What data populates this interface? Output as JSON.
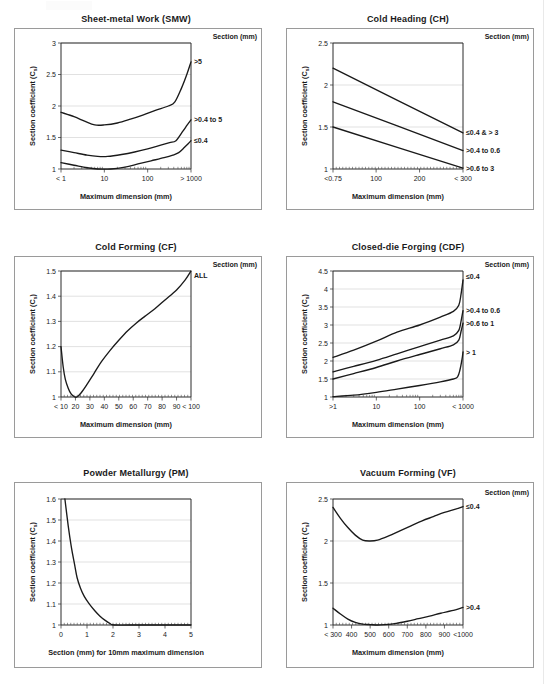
{
  "page": {
    "background": "#ffffff",
    "line_color": "#1a1a1a",
    "grid_color": "#d9d9d9",
    "panel_border_color": "#9a9a9a"
  },
  "common": {
    "ylabel": "Section coefficient (C",
    "ylabel_sub": "s",
    "ylabel_tail": ")",
    "section_header": "Section (mm)",
    "xlabel_maxdim": "Maximum dimension (mm)"
  },
  "charts": [
    {
      "id": "smw",
      "title": "Sheet-metal Work (SMW)",
      "chart_data": {
        "type": "line",
        "title": "Sheet-metal Work (SMW)",
        "xlabel": "Maximum dimension (mm)",
        "ylabel": "Section coefficient (C s)",
        "legend_title": "Section (mm)",
        "legend_position": "right-outside",
        "grid": true,
        "xscale": "log",
        "xlim": [
          1,
          1000
        ],
        "ylim": [
          1,
          3
        ],
        "yticks": [
          1,
          1.5,
          2,
          2.5,
          3
        ],
        "ytick_labels": [
          "1",
          "1.5",
          "2",
          "2.5",
          "3"
        ],
        "xticks": [
          1,
          10,
          100,
          1000
        ],
        "xtick_labels": [
          "< 1",
          "10",
          "100",
          "> 1000"
        ],
        "series": [
          {
            "name": "> 5",
            "label": "&gt;5",
            "points": [
              [
                1,
                1.9
              ],
              [
                2,
                1.83
              ],
              [
                3.5,
                1.76
              ],
              [
                6,
                1.7
              ],
              [
                10,
                1.7
              ],
              [
                20,
                1.73
              ],
              [
                40,
                1.79
              ],
              [
                80,
                1.86
              ],
              [
                150,
                1.93
              ],
              [
                300,
                2.0
              ],
              [
                420,
                2.06
              ],
              [
                600,
                2.28
              ],
              [
                800,
                2.5
              ],
              [
                1000,
                2.7
              ]
            ]
          },
          {
            "name": "> 0.4 to 5",
            "label": "&gt;0.4 to 5",
            "points": [
              [
                1,
                1.3
              ],
              [
                2,
                1.26
              ],
              [
                4,
                1.22
              ],
              [
                7,
                1.2
              ],
              [
                12,
                1.2
              ],
              [
                25,
                1.23
              ],
              [
                50,
                1.27
              ],
              [
                100,
                1.32
              ],
              [
                200,
                1.38
              ],
              [
                320,
                1.42
              ],
              [
                450,
                1.45
              ],
              [
                650,
                1.6
              ],
              [
                820,
                1.7
              ],
              [
                1000,
                1.78
              ]
            ]
          },
          {
            "name": "≤ 0.4",
            "label": "≤0.4",
            "points": [
              [
                1,
                1.1
              ],
              [
                2,
                1.06
              ],
              [
                4,
                1.02
              ],
              [
                7,
                1.0
              ],
              [
                14,
                1.0
              ],
              [
                30,
                1.03
              ],
              [
                60,
                1.08
              ],
              [
                120,
                1.13
              ],
              [
                240,
                1.18
              ],
              [
                380,
                1.22
              ],
              [
                520,
                1.26
              ],
              [
                700,
                1.34
              ],
              [
                860,
                1.4
              ],
              [
                1000,
                1.45
              ]
            ]
          }
        ]
      }
    },
    {
      "id": "ch",
      "title": "Cold Heading (CH)",
      "chart_data": {
        "type": "line",
        "title": "Cold Heading (CH)",
        "xlabel": "Maximum dimension (mm)",
        "ylabel": "Section coefficient (C s)",
        "legend_title": "Section (mm)",
        "legend_position": "right-outside",
        "grid": true,
        "xscale": "linear",
        "xlim": [
          0.75,
          300
        ],
        "ylim": [
          1,
          2.5
        ],
        "yticks": [
          1,
          1.5,
          2,
          2.5
        ],
        "ytick_labels": [
          "1",
          "1.5",
          "2",
          "2.5"
        ],
        "xticks": [
          0.75,
          100,
          200,
          300
        ],
        "xtick_labels": [
          "<0.75",
          "100",
          "200",
          "< 300"
        ],
        "series": [
          {
            "name": "≤0.4 & > 3",
            "label": "≤0.4 &amp; &gt; 3",
            "points": [
              [
                0.75,
                2.2
              ],
              [
                300,
                1.43
              ]
            ]
          },
          {
            "name": ">0.4 to 0.6",
            "label": "&gt;0.4 to 0.6",
            "points": [
              [
                0.75,
                1.8
              ],
              [
                300,
                1.22
              ]
            ]
          },
          {
            "name": ">0.6 to 3",
            "label": "&gt;0.6 to 3",
            "points": [
              [
                0.75,
                1.5
              ],
              [
                300,
                1.01
              ]
            ]
          }
        ]
      }
    },
    {
      "id": "cf",
      "title": "Cold Forming (CF)",
      "chart_data": {
        "type": "line",
        "title": "Cold Forming (CF)",
        "xlabel": "Maximum dimension (mm)",
        "ylabel": "Section coefficient (C s)",
        "legend_title": "Section (mm)",
        "legend_position": "right-outside",
        "grid": true,
        "xscale": "linear",
        "xlim": [
          10,
          100
        ],
        "ylim": [
          1,
          1.5
        ],
        "yticks": [
          1,
          1.1,
          1.2,
          1.3,
          1.4,
          1.5
        ],
        "ytick_labels": [
          "1",
          "1.1",
          "1.2",
          "1.3",
          "1.4",
          "1.5"
        ],
        "xticks": [
          10,
          20,
          30,
          40,
          50,
          60,
          70,
          80,
          90,
          100
        ],
        "xtick_labels": [
          "< 10",
          "20",
          "30",
          "40",
          "50",
          "60",
          "70",
          "80",
          "90",
          "< 100"
        ],
        "series": [
          {
            "name": "ALL",
            "label": "ALL",
            "points": [
              [
                10,
                1.2
              ],
              [
                11.5,
                1.12
              ],
              [
                13,
                1.07
              ],
              [
                15,
                1.035
              ],
              [
                17,
                1.012
              ],
              [
                19,
                1.002
              ],
              [
                21,
                1.0
              ],
              [
                24,
                1.017
              ],
              [
                28,
                1.05
              ],
              [
                33,
                1.095
              ],
              [
                38,
                1.14
              ],
              [
                44,
                1.185
              ],
              [
                50,
                1.225
              ],
              [
                56,
                1.262
              ],
              [
                62,
                1.293
              ],
              [
                68,
                1.32
              ],
              [
                75,
                1.35
              ],
              [
                82,
                1.385
              ],
              [
                90,
                1.425
              ],
              [
                96,
                1.465
              ],
              [
                100,
                1.5
              ]
            ]
          }
        ]
      }
    },
    {
      "id": "cdf",
      "title": "Closed-die Forging (CDF)",
      "chart_data": {
        "type": "line",
        "title": "Closed-die Forging (CDF)",
        "xlabel": "Maximum dimension (mm)",
        "ylabel": "Section coefficient (C s)",
        "legend_title": "Section (mm)",
        "legend_position": "right-outside",
        "grid": true,
        "xscale": "log",
        "xlim": [
          1,
          1000
        ],
        "ylim": [
          1,
          4.5
        ],
        "yticks": [
          1,
          1.5,
          2,
          2.5,
          3,
          3.5,
          4,
          4.5
        ],
        "ytick_labels": [
          "1",
          "1.5",
          "2",
          "2.5",
          "3",
          "3.5",
          "4",
          "4.5"
        ],
        "xticks": [
          1,
          10,
          100,
          1000
        ],
        "xtick_labels": [
          ">1",
          "10",
          "100",
          "< 1000"
        ],
        "series": [
          {
            "name": "≤0.4",
            "label": "≤0.4",
            "points": [
              [
                1,
                2.1
              ],
              [
                3,
                2.3
              ],
              [
                10,
                2.55
              ],
              [
                30,
                2.8
              ],
              [
                100,
                3.0
              ],
              [
                300,
                3.22
              ],
              [
                600,
                3.38
              ],
              [
                800,
                3.55
              ],
              [
                900,
                3.85
              ],
              [
                1000,
                4.25
              ]
            ]
          },
          {
            "name": ">0.4 to 0.6",
            "label": "&gt;0.4 to 0.6",
            "points": [
              [
                1,
                1.7
              ],
              [
                3,
                1.85
              ],
              [
                10,
                2.02
              ],
              [
                30,
                2.2
              ],
              [
                100,
                2.4
              ],
              [
                300,
                2.58
              ],
              [
                600,
                2.7
              ],
              [
                800,
                2.85
              ],
              [
                900,
                3.1
              ],
              [
                1000,
                3.4
              ]
            ]
          },
          {
            "name": ">0.6 to 1",
            "label": "&gt;0.6 to 1",
            "points": [
              [
                1,
                1.5
              ],
              [
                3,
                1.65
              ],
              [
                10,
                1.82
              ],
              [
                30,
                2.0
              ],
              [
                100,
                2.18
              ],
              [
                300,
                2.34
              ],
              [
                600,
                2.45
              ],
              [
                800,
                2.58
              ],
              [
                900,
                2.82
              ],
              [
                1000,
                3.05
              ]
            ]
          },
          {
            "name": "> 1",
            "label": "&gt; 1",
            "points": [
              [
                1,
                1.01
              ],
              [
                3,
                1.05
              ],
              [
                10,
                1.13
              ],
              [
                30,
                1.22
              ],
              [
                100,
                1.32
              ],
              [
                300,
                1.42
              ],
              [
                600,
                1.5
              ],
              [
                750,
                1.56
              ],
              [
                850,
                1.75
              ],
              [
                950,
                2.05
              ],
              [
                1000,
                2.25
              ]
            ]
          }
        ]
      }
    },
    {
      "id": "pm",
      "title": "Powder Metallurgy (PM)",
      "chart_data": {
        "type": "line",
        "title": "Powder Metallurgy (PM)",
        "xlabel": "Section (mm) for 10mm maximum dimension",
        "ylabel": "Section coefficient (C s)",
        "legend_title": "",
        "grid": true,
        "xscale": "linear",
        "xlim": [
          0,
          5
        ],
        "ylim": [
          1,
          1.6
        ],
        "yticks": [
          1,
          1.1,
          1.2,
          1.3,
          1.4,
          1.5,
          1.6
        ],
        "ytick_labels": [
          "1",
          "1.1",
          "1.2",
          "1.3",
          "1.4",
          "1.5",
          "1.6"
        ],
        "xticks": [
          0,
          1,
          2,
          3,
          4,
          5
        ],
        "xtick_labels": [
          "0",
          "1",
          "2",
          "3",
          "4",
          "5"
        ],
        "series": [
          {
            "name": "PM curve",
            "label": "",
            "points": [
              [
                0.15,
                1.6
              ],
              [
                0.28,
                1.47
              ],
              [
                0.4,
                1.37
              ],
              [
                0.52,
                1.29
              ],
              [
                0.62,
                1.225
              ],
              [
                0.75,
                1.175
              ],
              [
                0.9,
                1.135
              ],
              [
                1.1,
                1.098
              ],
              [
                1.3,
                1.068
              ],
              [
                1.5,
                1.042
              ],
              [
                1.7,
                1.022
              ],
              [
                1.9,
                1.006
              ],
              [
                2.05,
                1.0
              ],
              [
                3.0,
                1.0
              ],
              [
                4.0,
                1.0
              ],
              [
                5.0,
                1.0
              ]
            ]
          }
        ]
      }
    },
    {
      "id": "vf",
      "title": "Vacuum Forming (VF)",
      "chart_data": {
        "type": "line",
        "title": "Vacuum Forming (VF)",
        "xlabel": "Maximum dimension (mm)",
        "ylabel": "Section coefficient (C s)",
        "legend_title": "Section (mm)",
        "legend_position": "right-outside",
        "grid": true,
        "xscale": "linear",
        "xlim": [
          300,
          1000
        ],
        "ylim": [
          1,
          2.5
        ],
        "yticks": [
          1,
          1.5,
          2,
          2.5
        ],
        "ytick_labels": [
          "1",
          "1.5",
          "2",
          "2.5"
        ],
        "xticks": [
          300,
          400,
          500,
          600,
          700,
          800,
          900,
          1000
        ],
        "xtick_labels": [
          "< 300",
          "400",
          "500",
          "600",
          "700",
          "800",
          "900",
          "<1000"
        ],
        "series": [
          {
            "name": "≤0.4",
            "label": "≤0.4",
            "points": [
              [
                300,
                2.4
              ],
              [
                340,
                2.27
              ],
              [
                380,
                2.16
              ],
              [
                420,
                2.07
              ],
              [
                460,
                2.01
              ],
              [
                500,
                2.0
              ],
              [
                540,
                2.01
              ],
              [
                600,
                2.06
              ],
              [
                660,
                2.12
              ],
              [
                720,
                2.18
              ],
              [
                780,
                2.24
              ],
              [
                840,
                2.29
              ],
              [
                900,
                2.34
              ],
              [
                960,
                2.38
              ],
              [
                1000,
                2.41
              ]
            ]
          },
          {
            "name": ">0.4",
            "label": "&gt;0.4",
            "points": [
              [
                300,
                1.2
              ],
              [
                340,
                1.13
              ],
              [
                380,
                1.07
              ],
              [
                420,
                1.03
              ],
              [
                460,
                1.01
              ],
              [
                500,
                1.005
              ],
              [
                540,
                1.0
              ],
              [
                580,
                1.005
              ],
              [
                640,
                1.02
              ],
              [
                700,
                1.045
              ],
              [
                760,
                1.075
              ],
              [
                820,
                1.105
              ],
              [
                880,
                1.14
              ],
              [
                940,
                1.17
              ],
              [
                1000,
                1.21
              ]
            ]
          }
        ]
      }
    }
  ]
}
